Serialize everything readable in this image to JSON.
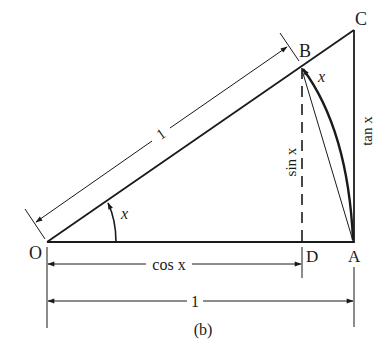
{
  "figure": {
    "caption": "(b)",
    "points": {
      "O": {
        "label": "O",
        "x": 47,
        "y": 242
      },
      "A": {
        "label": "A",
        "x": 354,
        "y": 242
      },
      "B": {
        "label": "B",
        "x": 300,
        "y": 66
      },
      "C": {
        "label": "C",
        "x": 354,
        "y": 30
      },
      "D": {
        "label": "D",
        "x": 302,
        "y": 242
      }
    },
    "labels": {
      "hypotenuse_length": "1",
      "angle_at_O": "x",
      "arc_angle": "x",
      "sin": "sin x",
      "tan": "tan x",
      "cos": "cos x",
      "base_length": "1"
    },
    "colors": {
      "ink": "#1a1a1a",
      "background": "#ffffff"
    }
  }
}
